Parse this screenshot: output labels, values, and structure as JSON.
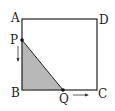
{
  "diagram": {
    "labels": {
      "A": "A",
      "B": "B",
      "C": "C",
      "D": "D",
      "P": "P",
      "Q": "Q"
    },
    "colors": {
      "stroke": "#222222",
      "shade": "#b8b8b8"
    }
  }
}
